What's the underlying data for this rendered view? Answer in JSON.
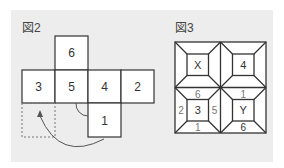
{
  "figure2": {
    "label": "図2",
    "cells": [
      {
        "name": "top",
        "value": "6"
      },
      {
        "name": "row-left",
        "value": "3"
      },
      {
        "name": "row-center",
        "value": "5"
      },
      {
        "name": "row-right",
        "value": "4"
      },
      {
        "name": "row-far-right",
        "value": "2"
      },
      {
        "name": "bottom",
        "value": "1"
      }
    ]
  },
  "figure3": {
    "label": "図3",
    "squares": {
      "top_left_center": "X",
      "top_right_center": "4",
      "bottom_left_center": "3",
      "bottom_right_center": "Y"
    },
    "edge_labels": {
      "bl_top": "6",
      "bl_left": "2",
      "bl_right": "5",
      "bl_bottom": "1",
      "br_top": "1",
      "br_bottom": "6"
    }
  }
}
